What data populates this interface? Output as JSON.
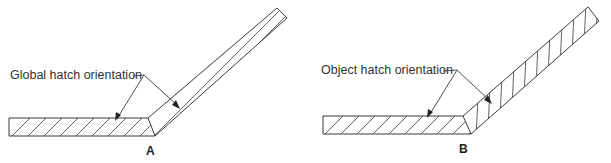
{
  "figures": [
    {
      "id": "A",
      "label": "A",
      "callout": "Global hatch orientation",
      "description": "Bent bar with hatching at a single global angle; hatch on angled arm runs nearly parallel to the arm"
    },
    {
      "id": "B",
      "label": "B",
      "callout": "Object hatch orientation",
      "description": "Bent bar with hatching aligned to each object; angled arm hatch rotated with the arm"
    }
  ],
  "colors": {
    "line": "#3a3a3a",
    "text": "#333333",
    "background": "#ffffff"
  }
}
